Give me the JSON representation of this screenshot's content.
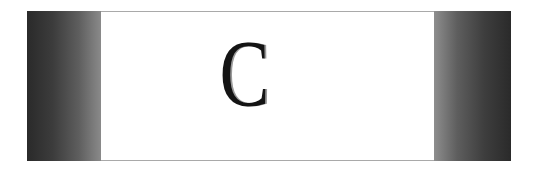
{
  "card": {
    "letter": "C",
    "colors": {
      "side_dark": "#2a2a2a",
      "side_light": "#8e8e8e",
      "center_bg": "#ffffff",
      "rule": "#a9a9a9",
      "letter": "#141414"
    }
  }
}
